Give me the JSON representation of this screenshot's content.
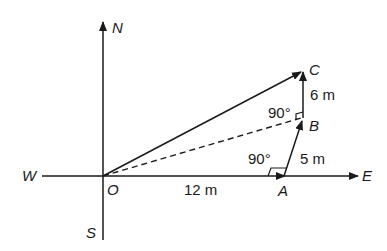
{
  "diagram": {
    "type": "displacement-vector",
    "compass": {
      "north": "N",
      "south": "S",
      "east": "E",
      "west": "W"
    },
    "points": {
      "O": {
        "label": "O"
      },
      "A": {
        "label": "A"
      },
      "B": {
        "label": "B"
      },
      "C": {
        "label": "C"
      }
    },
    "segments": {
      "OA": "12 m",
      "AB": "5 m",
      "BC": "6 m"
    },
    "angles": {
      "at_A": "90°",
      "at_B": "90°"
    },
    "colors": {
      "ink": "#1a1a1a",
      "background": "#ffffff"
    }
  }
}
